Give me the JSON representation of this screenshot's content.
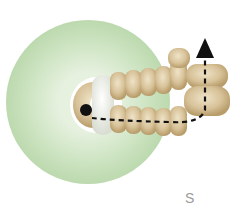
{
  "diagram": {
    "ring_bead": {
      "color": "#cfe5c4",
      "edge_color": "#b9d8aa",
      "hole_color": "#ffffff"
    },
    "seed_beads": {
      "color": "#d8c39a",
      "shade_color": "#b89c6a",
      "highlight_color": "#efe3c8",
      "top_row_count": 6,
      "bottom_row_count": 6,
      "end_column_count": 2
    },
    "white_bead": {
      "color": "#eef0ea"
    },
    "thread_path": {
      "style": "dashed",
      "color": "#111111",
      "start": "black dot inside ring",
      "end": "arrow pointing up"
    },
    "caption_fragment": "S"
  }
}
